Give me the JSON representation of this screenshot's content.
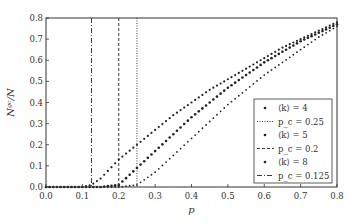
{
  "chart_data": {
    "type": "scatter",
    "title": "",
    "xlabel": "p",
    "ylabel": "N_gc/N",
    "xlim": [
      0.0,
      0.8
    ],
    "ylim": [
      0.0,
      0.8
    ],
    "xticks": [
      "0.0",
      "0.1",
      "0.2",
      "0.3",
      "0.4",
      "0.5",
      "0.6",
      "0.7",
      "0.8"
    ],
    "yticks": [
      "0.0",
      "0.1",
      "0.2",
      "0.3",
      "0.4",
      "0.5",
      "0.6",
      "0.7",
      "0.8"
    ],
    "grid": false,
    "legend_position": "lower right",
    "x": [
      0.0,
      0.05,
      0.1,
      0.125,
      0.15,
      0.2,
      0.25,
      0.3,
      0.35,
      0.4,
      0.45,
      0.5,
      0.55,
      0.6,
      0.65,
      0.7,
      0.75,
      0.8
    ],
    "series": [
      {
        "name": "⟨k⟩ = 4",
        "marker": "dot-small",
        "values": [
          0.0,
          0.0,
          0.0,
          0.0,
          0.0,
          0.0,
          0.01,
          0.07,
          0.15,
          0.23,
          0.31,
          0.39,
          0.46,
          0.53,
          0.59,
          0.65,
          0.71,
          0.76
        ]
      },
      {
        "name": "⟨k⟩ = 5",
        "marker": "dot-medium",
        "values": [
          0.0,
          0.0,
          0.0,
          0.0,
          0.0,
          0.01,
          0.09,
          0.17,
          0.25,
          0.33,
          0.4,
          0.47,
          0.53,
          0.59,
          0.64,
          0.69,
          0.73,
          0.77
        ]
      },
      {
        "name": "⟨k⟩ = 8",
        "marker": "dot",
        "values": [
          0.0,
          0.0,
          0.0,
          0.01,
          0.04,
          0.13,
          0.2,
          0.27,
          0.34,
          0.4,
          0.46,
          0.51,
          0.56,
          0.61,
          0.66,
          0.7,
          0.74,
          0.78
        ]
      }
    ],
    "vlines": [
      {
        "name": "p_c = 0.25",
        "x": 0.25,
        "style": "dotted"
      },
      {
        "name": "p_c = 0.2",
        "x": 0.2,
        "style": "dashed"
      },
      {
        "name": "p_c = 0.125",
        "x": 0.125,
        "style": "dash-dot"
      }
    ]
  },
  "legend": [
    {
      "label": "⟨k⟩ = 4"
    },
    {
      "label": "p_c = 0.25"
    },
    {
      "label": "⟨k⟩ = 5"
    },
    {
      "label": "p_c = 0.2"
    },
    {
      "label": "⟨k⟩ = 8"
    },
    {
      "label": "p_c = 0.125"
    }
  ]
}
